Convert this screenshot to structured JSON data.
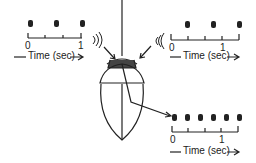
{
  "diagram": {
    "colors": {
      "ink": "#222222",
      "sensor": "#333333",
      "background": "#ffffff"
    },
    "panels": [
      {
        "id": "top-left",
        "tick_start": "0",
        "tick_end": "1",
        "axis_label": "Time (sec)",
        "pulse_count": 3
      },
      {
        "id": "top-right",
        "tick_start": "0",
        "tick_end": "1",
        "axis_label": "Time (sec)",
        "pulse_count": 3
      },
      {
        "id": "bottom-right",
        "tick_start": "0",
        "tick_end": "1",
        "axis_label": "Time (sec)",
        "pulse_count": 6
      }
    ],
    "icons": [
      "sound-wave-icon-left",
      "sound-wave-icon-right",
      "arrow-icon"
    ]
  }
}
